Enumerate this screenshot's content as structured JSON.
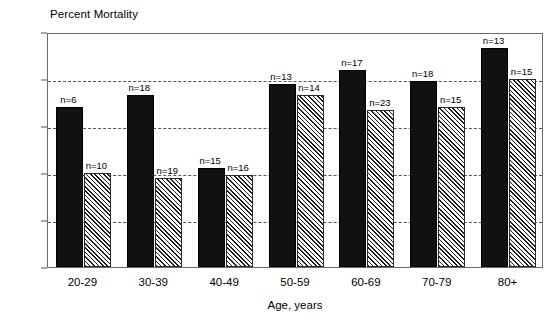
{
  "chart_data": {
    "type": "bar",
    "title": "",
    "ylabel": "Percent Mortality",
    "xlabel": "Age, years",
    "categories": [
      "20-29",
      "30-39",
      "40-49",
      "50-59",
      "60-69",
      "70-79",
      "80+"
    ],
    "ylim": [
      0,
      100
    ],
    "yticks": [
      0,
      20,
      40,
      60,
      80,
      100
    ],
    "ytick_labels": [
      "0",
      "20",
      "40",
      "60",
      "80",
      "100"
    ],
    "grid": "horizontal-dashed",
    "legend": "none",
    "series": [
      {
        "name": "solid-black-series",
        "style": "solid-black",
        "values": [
          68,
          73,
          42,
          78,
          84,
          79,
          93
        ],
        "annotations": [
          "n=6",
          "n=18",
          "n=15",
          "n=13",
          "n=17",
          "n=18",
          "n=13"
        ]
      },
      {
        "name": "hatched-series",
        "style": "diagonal-hatch",
        "values": [
          40,
          38,
          39,
          73,
          67,
          68,
          80
        ],
        "annotations": [
          "n=10",
          "n=19",
          "n=16",
          "n=14",
          "n=23",
          "n=15",
          "n=15"
        ]
      }
    ]
  },
  "axes": {
    "ylabel": "Percent Mortality",
    "xlabel": "Age, years"
  },
  "colors": {
    "solid_bar": "#111111",
    "hatch_line": "#1d1d1d",
    "grid": "#555555",
    "frame": "#6b6b6b",
    "background": "#ffffff",
    "text": "#000000"
  }
}
